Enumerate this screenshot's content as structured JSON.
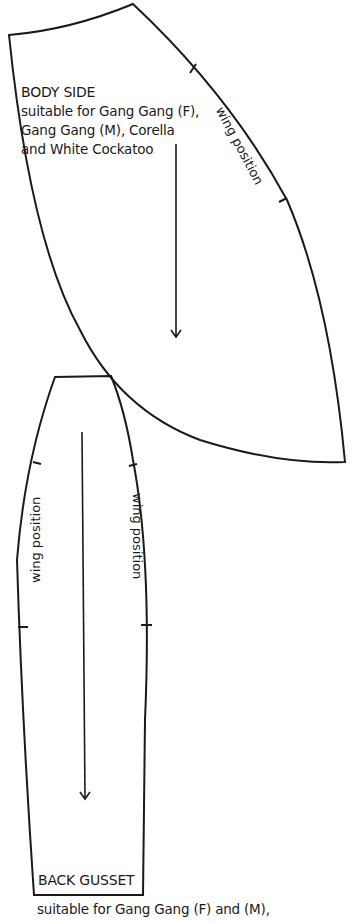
{
  "body_side": {
    "title": "BODY SIDE",
    "line1": "suitable for Gang Gang (F),",
    "line2": "Gang Gang (M), Corella",
    "line3": "and White Cockatoo",
    "wing_label": "wing position"
  },
  "back_gusset": {
    "title": "BACK GUSSET",
    "wing_label_left": "wing position",
    "wing_label_right": "wing position",
    "caption": "suitable for Gang Gang (F) and (M),"
  },
  "colors": {
    "ink": "#1a1a1a",
    "paper": "#ffffff"
  }
}
